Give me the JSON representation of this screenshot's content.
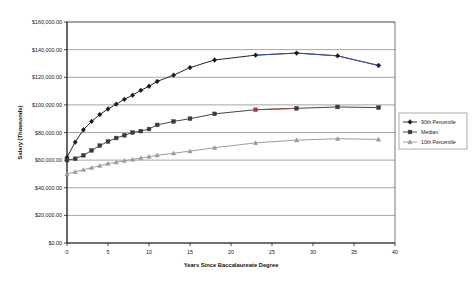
{
  "chart_data": {
    "type": "line",
    "title": "",
    "xlabel": "Years Since Baccalaureate Degree",
    "ylabel": "Salary (Thousands)",
    "xlim": [
      0,
      40
    ],
    "ylim": [
      0,
      160000
    ],
    "grid": true,
    "legend_position": "right",
    "x_ticks": [
      0,
      5,
      10,
      15,
      20,
      25,
      30,
      35,
      40
    ],
    "x_tick_labels": [
      "0",
      "5",
      "10",
      "15",
      "20",
      "25",
      "30",
      "35",
      "40"
    ],
    "y_ticks": [
      0,
      20000,
      40000,
      60000,
      80000,
      100000,
      120000,
      140000,
      160000
    ],
    "y_tick_labels": [
      "$0.00",
      "$20,000.00",
      "$40,000.00",
      "$60,000.00",
      "$80,000.00",
      "$100,000.00",
      "$120,000.00",
      "$140,000.00",
      "$160,000.00"
    ],
    "x": [
      0,
      1,
      2,
      3,
      4,
      5,
      6,
      7,
      8,
      9,
      10,
      11,
      13,
      15,
      18,
      23,
      28,
      33,
      38
    ],
    "series": [
      {
        "name": "90th Percentile",
        "marker": "diamond",
        "color": "#1a1a1a",
        "values": [
          62000,
          73000,
          82000,
          88000,
          93000,
          97000,
          100500,
          104000,
          107000,
          110500,
          113500,
          117000,
          121500,
          127000,
          132500,
          136000,
          137500,
          135500,
          128500
        ]
      },
      {
        "name": "Median",
        "marker": "square",
        "color": "#3a3a3a",
        "values": [
          60000,
          61000,
          63500,
          67000,
          70500,
          73500,
          76000,
          78000,
          80000,
          81000,
          82500,
          85500,
          88000,
          90000,
          93500,
          96500,
          97500,
          98500,
          98000
        ]
      },
      {
        "name": "10th Percentile",
        "marker": "triangle",
        "color": "#9a9a9a",
        "values": [
          50000,
          51500,
          53000,
          54500,
          56000,
          57500,
          58500,
          59500,
          60500,
          61500,
          62500,
          63500,
          65000,
          66500,
          69000,
          72500,
          74500,
          75500,
          75000
        ]
      }
    ],
    "highlight_segments": [
      {
        "series": "90th Percentile",
        "color": "#3b4ecc",
        "from_index": 15,
        "to_index": 17
      },
      {
        "series": "Median",
        "color": "#b03a3a",
        "from_index": 15,
        "to_index": 15
      }
    ]
  },
  "legend": {
    "items": [
      {
        "label": "90th Percentile"
      },
      {
        "label": "Median"
      },
      {
        "label": "10th Percentile"
      }
    ]
  }
}
